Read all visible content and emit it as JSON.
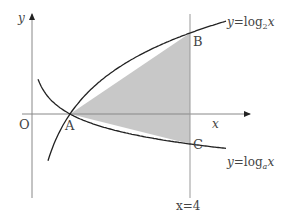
{
  "diagram": {
    "type": "function-graph",
    "axes": {
      "x_label": "x",
      "y_label": "y",
      "origin_label": "O"
    },
    "curves": [
      {
        "id": "log2",
        "label_prefix": "y=log",
        "label_base": "2",
        "label_suffix": "x"
      },
      {
        "id": "loga",
        "label_prefix": "y=log",
        "label_base": "a",
        "label_suffix": "x"
      }
    ],
    "vertical_line": {
      "label": "x=4",
      "x_value": 4
    },
    "points": [
      {
        "name": "A",
        "label": "A"
      },
      {
        "name": "B",
        "label": "B"
      },
      {
        "name": "C",
        "label": "C"
      }
    ],
    "shaded_region": "triangle ABC",
    "colors": {
      "shade": "#c8c8c8",
      "curve": "#222222",
      "axis": "#888888"
    }
  }
}
